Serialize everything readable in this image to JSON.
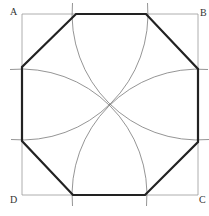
{
  "diagram": {
    "labels": {
      "a": "A",
      "b": "B",
      "c": "C",
      "d": "D"
    },
    "colors": {
      "square": "#999999",
      "arc": "#777777",
      "octagon": "#222222",
      "background": "#ffffff"
    }
  }
}
